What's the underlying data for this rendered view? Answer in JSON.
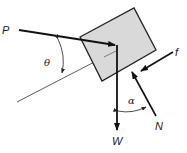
{
  "diagram": {
    "type": "free-body diagram",
    "labels": {
      "P": "P",
      "W": "W",
      "N": "N",
      "f": "f",
      "theta": "θ",
      "alpha": "α"
    },
    "colors": {
      "block_fill": "#d9d9d9",
      "block_stroke": "#222222",
      "arrow": "#111111",
      "incline_line": "#333333"
    }
  }
}
